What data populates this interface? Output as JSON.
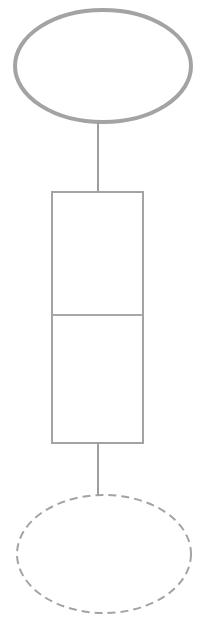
{
  "canvas": {
    "width": 208,
    "height": 619,
    "background": "#ffffff"
  },
  "diagram": {
    "type": "flowchart",
    "title": "",
    "stroke_color": "#a3a3a3",
    "divider_color": "#a8a8a8",
    "connector_color": "#9e9e9e",
    "fill_color": "#ffffff",
    "nodes": [
      {
        "id": "top-ellipse",
        "shape": "ellipse",
        "label": "",
        "stroke_style": "solid",
        "stroke_width": 4,
        "stroke_color": "#a3a3a3",
        "fill": "#ffffff",
        "cx": 103,
        "cy": 66,
        "rx": 88,
        "ry": 56
      },
      {
        "id": "split-rectangle",
        "shape": "rectangle",
        "label": "",
        "stroke_style": "solid",
        "stroke_width": 2,
        "stroke_color": "#a3a3a3",
        "fill": "#ffffff",
        "x": 51,
        "y": 191,
        "width": 92,
        "height": 252,
        "cells": [
          {
            "id": "rect-cell-upper",
            "label": "",
            "y": 191,
            "height": 124
          },
          {
            "id": "rect-cell-lower",
            "label": "",
            "y": 315,
            "height": 128
          }
        ],
        "divider": {
          "id": "rect-divider",
          "y": 315,
          "x1": 51,
          "x2": 143
        }
      },
      {
        "id": "bottom-ellipse",
        "shape": "ellipse",
        "label": "",
        "stroke_style": "dashed",
        "stroke_width": 2,
        "stroke_color": "#a3a3a3",
        "dash_pattern": "8 5",
        "fill": "#ffffff",
        "cx": 104,
        "cy": 554,
        "rx": 87,
        "ry": 59
      }
    ],
    "edges": [
      {
        "id": "edge-top",
        "from": "top-ellipse",
        "to": "split-rectangle",
        "label": "",
        "stroke_style": "solid",
        "stroke_width": 2,
        "x": 98,
        "y1": 122,
        "y2": 192
      },
      {
        "id": "edge-bottom",
        "from": "split-rectangle",
        "to": "bottom-ellipse",
        "label": "",
        "stroke_style": "solid",
        "stroke_width": 2,
        "x": 98,
        "y1": 442,
        "y2": 498
      }
    ]
  }
}
